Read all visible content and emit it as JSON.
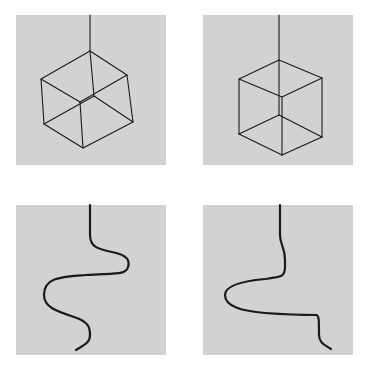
{
  "figure": {
    "background_color": "#ffffff",
    "panel_color": "#d2d2d2",
    "line_color": "#1a1a1a",
    "panels": [
      {
        "id": "top-left",
        "content": "wireframe cube hanging by a string, rotated view"
      },
      {
        "id": "top-right",
        "content": "wireframe cube hanging by a string, vertex-down view"
      },
      {
        "id": "bottom-left",
        "content": "wavy S-shaped curve descending from top"
      },
      {
        "id": "bottom-right",
        "content": "curve with single leftward loop descending from top"
      }
    ]
  }
}
